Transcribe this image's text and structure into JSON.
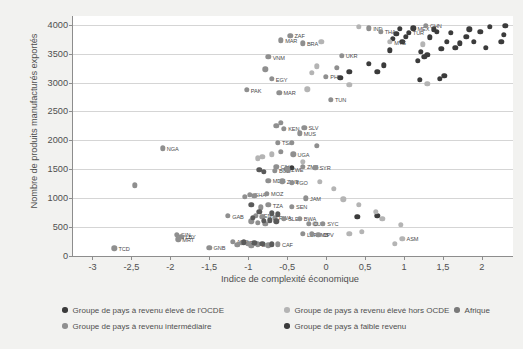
{
  "chart_data": {
    "type": "scatter",
    "title": "",
    "xlabel": "Indice de complexité économique",
    "ylabel": "Nombre de produits manufacturés exportés",
    "xlim": [
      -3.25,
      2.4
    ],
    "ylim": [
      0,
      4150
    ],
    "xticks": [
      "-3",
      "-2,5",
      "-2",
      "-1,5",
      "-1",
      "-0,5",
      "0",
      "0,5",
      "1",
      "1,5",
      "2"
    ],
    "xtickvalues": [
      -3,
      -2.5,
      -2,
      -1.5,
      -1,
      -0.5,
      0,
      0.5,
      1,
      1.5,
      2
    ],
    "yticks": [
      "0",
      "500",
      "1000",
      "1500",
      "2000",
      "2500",
      "3000",
      "3500",
      "4000"
    ],
    "ytickvalues": [
      0,
      500,
      1000,
      1500,
      2000,
      2500,
      3000,
      3500,
      4000
    ],
    "grid": "horizontal",
    "legend_position": "below",
    "series": [
      {
        "name": "Groupe de pays à revenu élevé de l'OCDE",
        "color": "#3b3b3b",
        "points": [
          {
            "x": 2.3,
            "y": 3980,
            "label": ""
          },
          {
            "x": 2.28,
            "y": 3830,
            "label": ""
          },
          {
            "x": 2.25,
            "y": 3700,
            "label": ""
          },
          {
            "x": 2.1,
            "y": 3960,
            "label": ""
          },
          {
            "x": 1.98,
            "y": 3875,
            "label": ""
          },
          {
            "x": 1.9,
            "y": 3700,
            "label": ""
          },
          {
            "x": 1.84,
            "y": 3920,
            "label": ""
          },
          {
            "x": 1.8,
            "y": 3790,
            "label": ""
          },
          {
            "x": 1.72,
            "y": 3680,
            "label": ""
          },
          {
            "x": 1.66,
            "y": 3600,
            "label": ""
          },
          {
            "x": 1.6,
            "y": 3860,
            "label": ""
          },
          {
            "x": 1.55,
            "y": 3700,
            "label": ""
          },
          {
            "x": 1.48,
            "y": 3580,
            "label": ""
          },
          {
            "x": 1.42,
            "y": 3880,
            "label": ""
          },
          {
            "x": 1.38,
            "y": 3920,
            "label": ""
          },
          {
            "x": 1.33,
            "y": 3780,
            "label": ""
          },
          {
            "x": 1.3,
            "y": 3480,
            "label": ""
          },
          {
            "x": 1.26,
            "y": 3440,
            "label": ""
          },
          {
            "x": 1.22,
            "y": 3530,
            "label": ""
          },
          {
            "x": 1.18,
            "y": 3380,
            "label": ""
          },
          {
            "x": 1.12,
            "y": 3940,
            "label": "MEX"
          },
          {
            "x": 1.06,
            "y": 3860,
            "label": "TUR"
          },
          {
            "x": 1.02,
            "y": 3790,
            "label": ""
          },
          {
            "x": 0.98,
            "y": 3700,
            "label": ""
          },
          {
            "x": 0.95,
            "y": 3930,
            "label": ""
          },
          {
            "x": 0.9,
            "y": 3840,
            "label": ""
          },
          {
            "x": 0.86,
            "y": 3760,
            "label": ""
          },
          {
            "x": 0.82,
            "y": 3560,
            "label": ""
          },
          {
            "x": 0.74,
            "y": 3300,
            "label": ""
          },
          {
            "x": 0.66,
            "y": 3180,
            "label": ""
          },
          {
            "x": 0.55,
            "y": 3320,
            "label": ""
          },
          {
            "x": 0.3,
            "y": 3180,
            "label": ""
          },
          {
            "x": 0.18,
            "y": 3080,
            "label": ""
          },
          {
            "x": 1.2,
            "y": 3050,
            "label": ""
          },
          {
            "x": 1.46,
            "y": 3060,
            "label": ""
          },
          {
            "x": 1.52,
            "y": 3120,
            "label": ""
          },
          {
            "x": 2.05,
            "y": 3600,
            "label": ""
          },
          {
            "x": -0.5,
            "y": 1500,
            "label": ""
          },
          {
            "x": -0.44,
            "y": 1520,
            "label": ""
          },
          {
            "x": 0.4,
            "y": 680,
            "label": ""
          },
          {
            "x": 0.66,
            "y": 700,
            "label": ""
          }
        ]
      },
      {
        "name": "Groupe de pays à revenu élevé hors OCDE",
        "color": "#b4b4b4",
        "points": [
          {
            "x": 0.42,
            "y": 3960,
            "label": ""
          },
          {
            "x": 0.82,
            "y": 3700,
            "label": "MYS"
          },
          {
            "x": 1.24,
            "y": 3660,
            "label": ""
          },
          {
            "x": -0.06,
            "y": 3700,
            "label": ""
          },
          {
            "x": -0.12,
            "y": 3280,
            "label": ""
          },
          {
            "x": -0.18,
            "y": 3170,
            "label": ""
          },
          {
            "x": 0.3,
            "y": 2960,
            "label": ""
          },
          {
            "x": -0.24,
            "y": 2880,
            "label": ""
          },
          {
            "x": -0.7,
            "y": 1760,
            "label": ""
          },
          {
            "x": -0.82,
            "y": 1720,
            "label": ""
          },
          {
            "x": -0.88,
            "y": 1690,
            "label": ""
          },
          {
            "x": -0.3,
            "y": 1630,
            "label": ""
          },
          {
            "x": -0.08,
            "y": 1280,
            "label": ""
          },
          {
            "x": 0.1,
            "y": 1160,
            "label": ""
          },
          {
            "x": 0.22,
            "y": 980,
            "label": ""
          },
          {
            "x": 0.42,
            "y": 880,
            "label": ""
          },
          {
            "x": 0.64,
            "y": 760,
            "label": ""
          },
          {
            "x": 0.72,
            "y": 640,
            "label": ""
          },
          {
            "x": 0.96,
            "y": 540,
            "label": ""
          },
          {
            "x": 0.46,
            "y": 420,
            "label": ""
          },
          {
            "x": 0.98,
            "y": 300,
            "label": "ASM"
          },
          {
            "x": 0.88,
            "y": 210,
            "label": ""
          },
          {
            "x": 0.3,
            "y": 380,
            "label": ""
          },
          {
            "x": -0.14,
            "y": 560,
            "label": ""
          },
          {
            "x": 1.3,
            "y": 2980,
            "label": ""
          }
        ]
      },
      {
        "name": "Groupe de pays à revenu intermédiaire",
        "color": "#8f8f8f",
        "points": [
          {
            "x": 1.28,
            "y": 3980,
            "label": "CHN"
          },
          {
            "x": 0.55,
            "y": 3940,
            "label": "IND"
          },
          {
            "x": 0.7,
            "y": 3880,
            "label": "THA"
          },
          {
            "x": -0.46,
            "y": 3810,
            "label": "ZAF"
          },
          {
            "x": -0.58,
            "y": 3730,
            "label": "MAR"
          },
          {
            "x": -0.3,
            "y": 3680,
            "label": "BRA"
          },
          {
            "x": -0.74,
            "y": 3440,
            "label": "VNM"
          },
          {
            "x": -0.78,
            "y": 3230,
            "label": ""
          },
          {
            "x": -0.7,
            "y": 3060,
            "label": "EGY"
          },
          {
            "x": 0.0,
            "y": 3100,
            "label": "PHL"
          },
          {
            "x": 0.14,
            "y": 3250,
            "label": ""
          },
          {
            "x": 0.2,
            "y": 3460,
            "label": "UKR"
          },
          {
            "x": -1.02,
            "y": 2870,
            "label": "PAK"
          },
          {
            "x": -0.6,
            "y": 2820,
            "label": "MAR"
          },
          {
            "x": 0.06,
            "y": 2700,
            "label": "TUN"
          },
          {
            "x": -0.58,
            "y": 2300,
            "label": ""
          },
          {
            "x": -0.64,
            "y": 2250,
            "label": ""
          },
          {
            "x": -0.54,
            "y": 2200,
            "label": "KEN"
          },
          {
            "x": -0.28,
            "y": 2220,
            "label": "SLV"
          },
          {
            "x": -0.34,
            "y": 2120,
            "label": "MUS"
          },
          {
            "x": -0.62,
            "y": 1960,
            "label": "TSA"
          },
          {
            "x": -2.1,
            "y": 1860,
            "label": "NGA"
          },
          {
            "x": -0.44,
            "y": 1960,
            "label": ""
          },
          {
            "x": -0.12,
            "y": 1910,
            "label": ""
          },
          {
            "x": -0.58,
            "y": 1800,
            "label": ""
          },
          {
            "x": -0.42,
            "y": 1760,
            "label": "UGA"
          },
          {
            "x": -0.64,
            "y": 1540,
            "label": "CIV"
          },
          {
            "x": -0.66,
            "y": 1470,
            "label": "BGD"
          },
          {
            "x": -0.5,
            "y": 1500,
            "label": "ZWE"
          },
          {
            "x": -0.3,
            "y": 1540,
            "label": "ZMB"
          },
          {
            "x": -0.14,
            "y": 1530,
            "label": "SYR"
          },
          {
            "x": -0.74,
            "y": 1300,
            "label": "MDG"
          },
          {
            "x": -0.56,
            "y": 1290,
            "label": "ZWE"
          },
          {
            "x": -0.44,
            "y": 1270,
            "label": "TGO"
          },
          {
            "x": -0.98,
            "y": 1060,
            "label": "GHA"
          },
          {
            "x": -0.92,
            "y": 1040,
            "label": ""
          },
          {
            "x": -1.04,
            "y": 1020,
            "label": ""
          },
          {
            "x": -0.76,
            "y": 1080,
            "label": "MOZ"
          },
          {
            "x": -0.26,
            "y": 1000,
            "label": "JAM"
          },
          {
            "x": -0.74,
            "y": 880,
            "label": "TZA"
          },
          {
            "x": -0.84,
            "y": 840,
            "label": ""
          },
          {
            "x": -0.44,
            "y": 850,
            "label": "SEN"
          },
          {
            "x": -1.26,
            "y": 690,
            "label": "GAB"
          },
          {
            "x": -0.9,
            "y": 700,
            "label": "KEN"
          },
          {
            "x": -0.82,
            "y": 680,
            "label": ""
          },
          {
            "x": -0.66,
            "y": 660,
            "label": "RWA"
          },
          {
            "x": -0.54,
            "y": 640,
            "label": "SLE"
          },
          {
            "x": -0.34,
            "y": 640,
            "label": "BWA"
          },
          {
            "x": -0.96,
            "y": 600,
            "label": ""
          },
          {
            "x": -0.88,
            "y": 570,
            "label": ""
          },
          {
            "x": -0.78,
            "y": 560,
            "label": ""
          },
          {
            "x": -0.22,
            "y": 560,
            "label": "CUB"
          },
          {
            "x": -0.04,
            "y": 560,
            "label": "SYC"
          },
          {
            "x": -0.3,
            "y": 380,
            "label": "LBR"
          },
          {
            "x": -0.18,
            "y": 380,
            "label": "GMB"
          },
          {
            "x": -0.1,
            "y": 370,
            "label": "CPV"
          },
          {
            "x": -1.92,
            "y": 370,
            "label": "GIN"
          },
          {
            "x": -1.86,
            "y": 330,
            "label": "LBY"
          },
          {
            "x": -1.9,
            "y": 290,
            "label": "MRT"
          },
          {
            "x": -1.5,
            "y": 140,
            "label": "GNB"
          },
          {
            "x": -1.2,
            "y": 250,
            "label": "ANG"
          },
          {
            "x": -1.08,
            "y": 230,
            "label": "BEN"
          },
          {
            "x": -1.0,
            "y": 215,
            "label": "COM"
          },
          {
            "x": -0.88,
            "y": 200,
            "label": "BDI"
          },
          {
            "x": -0.62,
            "y": 205,
            "label": "CAF"
          },
          {
            "x": -2.72,
            "y": 130,
            "label": "TCD"
          },
          {
            "x": -2.46,
            "y": 1220,
            "label": ""
          },
          {
            "x": -1.14,
            "y": 190,
            "label": ""
          },
          {
            "x": -0.96,
            "y": 175,
            "label": ""
          },
          {
            "x": -0.74,
            "y": 185,
            "label": ""
          }
        ]
      },
      {
        "name": "Groupe de pays à faible revenu",
        "color": "#5a5a5a",
        "points": [
          {
            "x": -0.86,
            "y": 1490,
            "label": ""
          },
          {
            "x": -0.8,
            "y": 1460,
            "label": ""
          },
          {
            "x": -0.96,
            "y": 880,
            "label": ""
          },
          {
            "x": -0.86,
            "y": 760,
            "label": ""
          },
          {
            "x": -0.7,
            "y": 740,
            "label": ""
          },
          {
            "x": -0.62,
            "y": 720,
            "label": ""
          },
          {
            "x": -0.94,
            "y": 660,
            "label": ""
          },
          {
            "x": -0.72,
            "y": 620,
            "label": ""
          },
          {
            "x": -0.8,
            "y": 610,
            "label": ""
          },
          {
            "x": -0.64,
            "y": 600,
            "label": ""
          },
          {
            "x": -1.06,
            "y": 240,
            "label": ""
          },
          {
            "x": -0.92,
            "y": 225,
            "label": ""
          },
          {
            "x": -0.82,
            "y": 215,
            "label": ""
          },
          {
            "x": -0.7,
            "y": 200,
            "label": ""
          }
        ]
      },
      {
        "name": "Afrique",
        "color": "#7a7a7a",
        "points": []
      }
    ]
  },
  "legend": {
    "rows": [
      [
        {
          "label": "Groupe de pays à revenu élevé de l'OCDE",
          "color": "#3b3b3b"
        },
        {
          "label": "Groupe de pays à revenu élevé hors OCDE",
          "color": "#b4b4b4"
        },
        {
          "label": "Afrique",
          "color": "#7a7a7a"
        }
      ],
      [
        {
          "label": "Groupe de pays à revenu intermédiaire",
          "color": "#8f8f8f"
        },
        {
          "label": "Groupe de pays à faible revenu",
          "color": "#3b3b3b"
        }
      ]
    ]
  }
}
